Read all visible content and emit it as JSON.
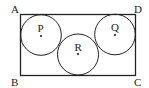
{
  "diagram": {
    "type": "geometry",
    "rectangle": {
      "vertices": {
        "top_left": "A",
        "top_right": "D",
        "bottom_left": "B",
        "bottom_right": "C"
      }
    },
    "circles": [
      {
        "label": "P",
        "position": "top-left, tangent to AB and AD"
      },
      {
        "label": "R",
        "position": "bottom-center, tangent to BC, P and Q"
      },
      {
        "label": "Q",
        "position": "top-right, tangent to DC and AD"
      }
    ],
    "colors": {
      "stroke": "#222222",
      "background": "#ffffff"
    }
  }
}
